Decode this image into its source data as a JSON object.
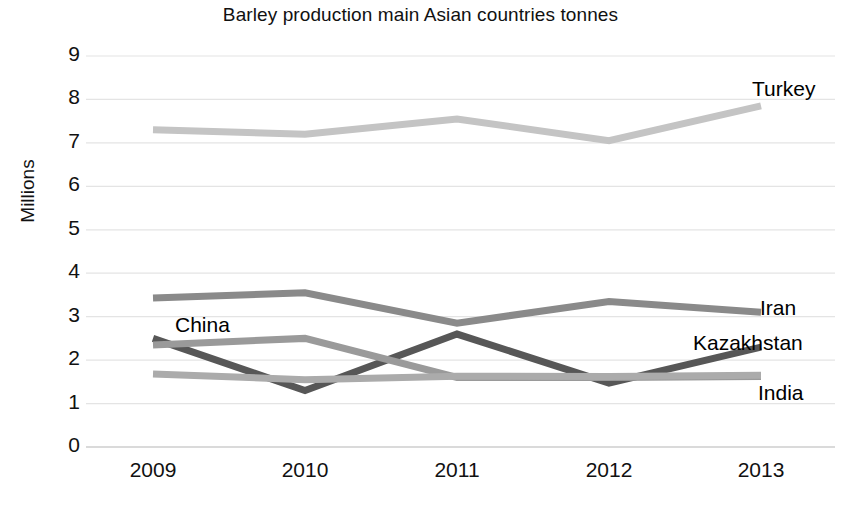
{
  "chart_data": {
    "type": "line",
    "title": "Barley production main Asian countries tonnes",
    "xlabel": "",
    "ylabel": "Millions",
    "categories": [
      "2009",
      "2010",
      "2011",
      "2012",
      "2013"
    ],
    "x": [
      2009,
      2010,
      2011,
      2012,
      2013
    ],
    "ylim": [
      0,
      9
    ],
    "yticks": [
      "0",
      "1",
      "2",
      "3",
      "4",
      "5",
      "6",
      "7",
      "8",
      "9"
    ],
    "grid": true,
    "legend_position": "inline-right-labels",
    "series": [
      {
        "name": "Turkey",
        "color": "#c4c4c4",
        "values": [
          7.3,
          7.2,
          7.55,
          7.05,
          7.85
        ],
        "label_x": 752,
        "label_y": 77
      },
      {
        "name": "Iran",
        "color": "#8a8a8a",
        "values": [
          3.43,
          3.55,
          2.85,
          3.35,
          3.1
        ],
        "label_x": 760,
        "label_y": 296
      },
      {
        "name": "Kazakhstan",
        "color": "#575757",
        "values": [
          2.5,
          1.3,
          2.6,
          1.47,
          2.3
        ],
        "label_x": 693,
        "label_y": 331
      },
      {
        "name": "China",
        "color": "#9a9a9a",
        "values": [
          2.35,
          2.5,
          1.6,
          1.6,
          1.62
        ],
        "label_x": 175,
        "label_y": 313
      },
      {
        "name": "India",
        "color": "#ababab",
        "values": [
          1.68,
          1.55,
          1.63,
          1.62,
          1.65
        ],
        "label_x": 758,
        "label_y": 381
      }
    ]
  }
}
